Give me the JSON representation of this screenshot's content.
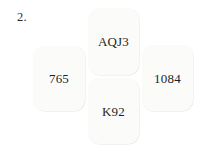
{
  "diagram": {
    "item_number": "2.",
    "type": "bridge-hand-compass-layout",
    "cards": [
      {
        "position": "north",
        "holding": "AQJ3"
      },
      {
        "position": "west",
        "holding": "765"
      },
      {
        "position": "east",
        "holding": "1084"
      },
      {
        "position": "south",
        "holding": "K92"
      }
    ]
  },
  "colors": {
    "card_border": "#3a3a3a",
    "card_fill": "#fbfbfa",
    "text": "#1f1f1f",
    "background": "#ffffff"
  }
}
